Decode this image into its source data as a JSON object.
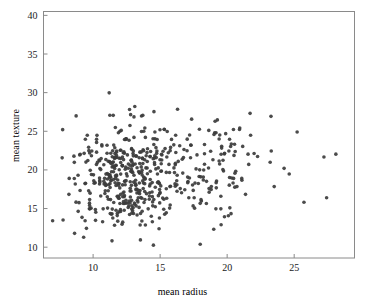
{
  "chart_data": {
    "type": "scatter",
    "title": "",
    "xlabel": "mean radius",
    "ylabel": "mean texture",
    "xlim": [
      6.3,
      29.5
    ],
    "ylim": [
      8.6,
      40.5
    ],
    "xticks": [
      10,
      15,
      20,
      25
    ],
    "xticklabels": [
      "10",
      "15",
      "20",
      "25"
    ],
    "yticks": [
      10,
      15,
      20,
      25,
      30,
      35,
      40
    ],
    "yticklabels": [
      "10",
      "15",
      "20",
      "25",
      "30",
      "35",
      "40"
    ],
    "grid": false,
    "legend": null,
    "n_points": 569,
    "marker": {
      "shape": "circle",
      "size_px": 3.6,
      "color": "#3c3c3c",
      "opacity": 0.92
    },
    "frame": {
      "color": "#8a8a8a",
      "visible": true
    },
    "background": "#ffffff",
    "x": [
      17.99,
      20.57,
      19.69,
      11.42,
      20.29,
      12.45,
      18.25,
      13.71,
      13.0,
      12.46,
      16.02,
      15.78,
      19.17,
      15.85,
      13.73,
      14.54,
      14.68,
      16.13,
      19.81,
      13.54,
      13.08,
      9.504,
      15.34,
      21.16,
      16.65,
      17.14,
      14.58,
      18.61,
      15.3,
      17.57,
      18.63,
      11.84,
      17.02,
      19.27,
      16.13,
      16.74,
      14.25,
      13.03,
      14.99,
      13.48,
      13.44,
      10.95,
      19.07,
      13.28,
      13.17,
      18.65,
      8.196,
      13.17,
      12.05,
      13.49,
      11.76,
      13.64,
      11.94,
      18.22,
      15.1,
      11.52,
      19.21,
      14.71,
      13.05,
      8.618,
      10.17,
      8.598,
      14.25,
      9.173,
      12.68,
      14.78,
      9.465,
      11.31,
      9.029,
      12.78,
      18.94,
      8.888,
      17.2,
      13.8,
      12.31,
      16.07,
      13.53,
      18.05,
      20.18,
      12.86,
      11.45,
      13.34,
      25.22,
      19.1,
      12.0,
      18.46,
      14.48,
      19.02,
      12.36,
      14.64,
      14.62,
      15.37,
      13.27,
      13.45,
      15.06,
      20.26,
      12.18,
      9.787,
      11.6,
      14.42,
      13.61,
      6.981,
      12.18,
      9.876,
      10.49,
      13.11,
      11.64,
      12.36,
      22.27,
      11.34,
      9.777,
      12.63,
      14.26,
      10.51,
      8.726,
      11.93,
      8.95,
      14.87,
      15.78,
      17.95,
      11.41,
      18.66,
      24.25,
      14.5,
      13.37,
      13.85,
      13.61,
      19.0,
      15.1,
      19.79,
      12.19,
      15.46,
      16.16,
      15.71,
      18.45,
      12.77,
      11.71,
      11.43,
      14.95,
      11.28,
      9.738,
      16.11,
      11.43,
      12.9,
      10.75,
      11.9,
      11.8,
      14.95,
      14.44,
      13.74,
      13.0,
      8.219,
      9.731,
      11.15,
      13.15,
      12.25,
      17.68,
      16.84,
      12.06,
      10.9,
      11.75,
      19.19,
      19.59,
      12.34,
      23.27,
      14.97,
      10.8,
      16.78,
      17.47,
      14.97,
      12.32,
      13.43,
      15.46,
      11.08,
      10.66,
      8.671,
      9.904,
      16.46,
      13.01,
      12.81,
      27.22,
      21.09,
      15.7,
      11.41,
      15.28,
      10.08,
      18.31,
      11.71,
      11.81,
      12.3,
      14.22,
      12.77,
      9.72,
      12.34,
      14.86,
      12.91,
      13.77,
      18.08,
      19.18,
      14.45,
      12.23,
      17.54,
      23.29,
      13.81,
      12.47,
      15.12,
      9.876,
      17.01,
      13.11,
      15.27,
      20.58,
      11.84,
      28.11,
      17.42,
      14.19,
      13.86,
      11.89,
      10.2,
      19.8,
      19.53,
      13.65,
      13.56,
      10.18,
      15.75,
      13.27,
      14.34,
      10.44,
      15.0,
      12.62,
      12.83,
      17.05,
      11.32,
      11.22,
      20.51,
      9.567,
      14.03,
      23.21,
      20.48,
      14.22,
      17.46,
      13.64,
      12.42,
      11.3,
      13.75,
      19.4,
      10.48,
      13.2,
      12.89,
      10.65,
      11.52,
      20.94,
      11.5,
      19.73,
      17.3,
      19.45,
      13.96,
      19.55,
      15.32,
      15.66,
      15.53,
      20.31,
      17.35,
      17.29,
      15.61,
      17.19,
      20.73,
      10.6,
      13.59,
      12.87,
      10.71,
      14.29,
      11.29,
      21.75,
      9.742,
      17.93,
      11.89,
      11.33,
      18.81,
      13.59,
      13.85,
      19.16,
      11.74,
      19.4,
      16.24,
      12.89,
      12.58,
      11.94,
      12.89,
      11.26,
      11.37,
      14.41,
      14.96,
      12.95,
      11.85,
      12.72,
      13.77,
      10.91,
      11.76,
      14.26,
      10.51,
      19.53,
      12.46,
      20.09,
      10.49,
      11.46,
      11.6,
      13.2,
      9.0,
      13.5,
      13.05,
      11.7,
      14.61,
      12.76,
      11.54,
      8.597,
      12.49,
      12.18,
      18.22,
      9.042,
      12.43,
      10.25,
      20.16,
      12.86,
      20.34,
      12.2,
      12.67,
      14.11,
      12.03,
      16.27,
      16.26,
      16.03,
      12.98,
      11.22,
      11.25,
      12.3,
      17.06,
      12.99,
      18.77,
      10.05,
      23.51,
      14.42,
      9.606,
      11.06,
      19.68,
      11.71,
      10.26,
      12.06,
      14.76,
      11.47,
      11.95,
      11.66,
      15.75,
      25.73,
      15.08,
      11.14,
      12.56,
      13.05,
      13.87,
      8.878,
      9.436,
      12.54,
      13.3,
      12.76,
      16.5,
      13.4,
      20.44,
      20.2,
      12.21,
      21.71,
      22.01,
      16.35,
      15.19,
      21.37,
      20.64,
      13.69,
      16.17,
      10.57,
      13.46,
      13.66,
      11.08,
      11.27,
      11.04,
      12.05,
      12.39,
      13.28,
      14.6,
      12.21,
      13.88,
      11.27,
      19.55,
      10.26,
      8.734,
      15.49,
      21.61,
      12.1,
      14.06,
      13.51,
      12.8,
      11.06,
      11.8,
      17.91,
      11.93,
      12.96,
      12.94,
      12.34,
      10.94,
      16.14,
      12.85,
      17.99,
      12.27,
      11.36,
      11.04,
      9.397,
      14.99,
      15.13,
      11.89,
      9.405,
      15.5,
      12.7,
      11.16,
      11.57,
      14.69,
      11.61,
      13.66,
      9.742,
      10.03,
      10.48,
      10.8,
      11.13,
      12.72,
      14.9,
      12.4,
      20.18,
      18.82,
      14.86,
      13.98,
      12.87,
      14.04,
      13.85,
      14.02,
      10.97,
      17.27,
      13.78,
      10.57,
      18.03,
      11.99,
      17.75,
      14.8,
      14.53,
      21.1,
      11.87,
      19.59,
      12.0,
      14.53,
      12.62,
      13.38,
      11.63,
      13.21,
      13.0,
      9.755,
      17.08,
      27.42,
      14.4,
      11.6,
      13.17,
      13.24,
      13.14,
      9.668,
      17.6,
      11.62,
      9.667,
      12.04,
      14.92,
      12.27,
      10.88,
      12.83,
      14.2,
      13.9,
      11.49,
      16.25,
      12.16,
      13.9,
      13.47,
      13.7,
      15.73,
      12.45,
      14.64,
      19.44,
      11.68,
      16.69,
      12.25,
      17.85,
      18.31,
      11.22,
      12.06,
      16.3,
      15.46,
      11.74,
      14.81,
      13.4,
      14.58,
      15.05,
      11.34,
      18.31,
      19.89,
      12.88,
      12.75,
      9.295,
      24.63,
      11.26,
      13.71,
      9.847,
      8.571,
      13.46,
      12.34,
      13.94,
      12.07,
      11.75,
      11.67,
      13.68,
      20.47,
      10.96,
      20.55,
      14.27,
      11.69,
      7.729,
      7.691,
      11.54,
      14.47,
      14.74,
      13.21,
      13.87,
      13.62,
      10.32,
      10.26,
      9.683,
      10.82,
      10.86,
      11.13,
      12.77,
      9.333,
      12.88,
      10.29,
      10.16,
      9.423,
      14.59,
      11.51,
      14.05,
      11.2,
      15.22,
      20.92,
      21.56,
      20.13,
      16.6,
      20.6,
      7.76
    ],
    "y": [
      10.38,
      17.77,
      21.25,
      20.38,
      14.34,
      15.7,
      19.98,
      20.83,
      21.82,
      24.04,
      23.24,
      17.89,
      24.8,
      23.95,
      22.61,
      27.54,
      20.13,
      20.68,
      22.15,
      14.36,
      15.71,
      12.44,
      14.26,
      23.04,
      21.38,
      16.4,
      21.53,
      20.25,
      25.27,
      15.05,
      25.11,
      18.7,
      23.98,
      26.47,
      17.88,
      21.59,
      21.72,
      18.42,
      25.2,
      20.82,
      21.58,
      21.35,
      24.81,
      20.28,
      18.66,
      17.6,
      16.84,
      21.81,
      14.63,
      22.3,
      21.6,
      16.34,
      18.24,
      18.7,
      22.02,
      18.75,
      18.57,
      21.59,
      19.31,
      11.79,
      14.88,
      20.98,
      21.72,
      13.86,
      23.84,
      23.94,
      21.01,
      19.04,
      17.33,
      16.49,
      21.31,
      14.64,
      24.52,
      15.79,
      16.52,
      19.65,
      10.94,
      16.15,
      23.97,
      18.0,
      20.97,
      15.86,
      24.91,
      26.29,
      15.65,
      18.52,
      21.46,
      24.59,
      18.54,
      15.24,
      24.02,
      22.76,
      17.02,
      18.3,
      19.83,
      23.03,
      20.52,
      19.94,
      12.84,
      16.54,
      24.98,
      13.43,
      20.58,
      19.4,
      18.61,
      15.56,
      18.33,
      18.54,
      21.73,
      18.61,
      16.99,
      20.76,
      18.17,
      20.19,
      15.83,
      21.53,
      15.76,
      16.67,
      22.91,
      20.01,
      10.82,
      17.12,
      20.2,
      10.26,
      16.39,
      17.21,
      26.97,
      12.33,
      19.86,
      22.07,
      21.68,
      19.68,
      24.49,
      15.06,
      15.65,
      20.59,
      17.98,
      14.93,
      13.77,
      14.36,
      15.39,
      18.19,
      21.71,
      15.35,
      14.96,
      16.33,
      14.09,
      18.22,
      15.86,
      17.6,
      20.7,
      18.9,
      15.7,
      19.39,
      18.22,
      22.22,
      20.13,
      17.43,
      20.96,
      18.22,
      19.34,
      17.68,
      22.82,
      22.15,
      26.93,
      16.95,
      20.67,
      22.64,
      17.35,
      15.73,
      14.78,
      15.15,
      14.45,
      18.82,
      23.09,
      18.17,
      22.45,
      23.12,
      14.36,
      19.82,
      21.68,
      18.9,
      19.67,
      14.32,
      16.21,
      18.28,
      20.74,
      14.78,
      14.38,
      17.15,
      17.93,
      18.47,
      14.97,
      15.67,
      18.47,
      21.0,
      19.07,
      15.98,
      18.35,
      15.35,
      17.0,
      16.39,
      22.44,
      18.94,
      24.04,
      21.28,
      21.84,
      22.48,
      28.21,
      14.9,
      19.56,
      13.37,
      22.04,
      18.05,
      16.21,
      25.42,
      24.81,
      14.52,
      13.93,
      16.59,
      19.97,
      16.41,
      13.47,
      15.46,
      17.48,
      14.0,
      21.28,
      17.07,
      15.15,
      17.27,
      19.07,
      22.15,
      19.07,
      21.88,
      24.49,
      20.25,
      21.0,
      18.9,
      17.05,
      15.34,
      13.39,
      23.95,
      16.16,
      18.31,
      24.0,
      18.95,
      17.44,
      19.73,
      23.24,
      19.77,
      25.42,
      27.06,
      19.86,
      23.19,
      24.52,
      21.84,
      22.02,
      25.22,
      20.71,
      24.98,
      23.34,
      26.57,
      23.22,
      22.22,
      18.95,
      17.84,
      21.47,
      20.39,
      16.06,
      13.29,
      22.39,
      19.12,
      24.48,
      16.16,
      25.27,
      18.03,
      18.65,
      17.46,
      22.33,
      21.31,
      14.96,
      21.9,
      21.15,
      18.6,
      19.9,
      15.71,
      16.33,
      14.41,
      18.22,
      19.76,
      18.36,
      17.46,
      14.71,
      18.23,
      27.81,
      22.47,
      17.31,
      22.44,
      18.75,
      18.45,
      14.96,
      18.61,
      14.06,
      21.18,
      22.47,
      21.49,
      18.05,
      21.94,
      17.33,
      24.21,
      20.58,
      24.91,
      15.73,
      23.21,
      18.89,
      19.49,
      20.56,
      19.07,
      22.02,
      20.37,
      20.7,
      18.03,
      21.26,
      18.95,
      18.06,
      15.35,
      14.96,
      22.55,
      19.31,
      17.24,
      20.26,
      22.13,
      19.38,
      27.08,
      22.33,
      18.35,
      15.11,
      22.41,
      18.6,
      17.84,
      13.29,
      21.21,
      19.54,
      20.04,
      20.6,
      23.97,
      16.84,
      22.44,
      13.78,
      20.03,
      25.49,
      22.49,
      15.82,
      20.8,
      16.21,
      21.94,
      26.86,
      18.79,
      19.31,
      18.26,
      19.21,
      16.07,
      17.27,
      17.58,
      17.05,
      18.3,
      15.09,
      13.24,
      27.32,
      22.13,
      21.1,
      16.35,
      16.84,
      19.83,
      21.46,
      22.26,
      20.04,
      19.59,
      14.65,
      15.06,
      17.72,
      22.16,
      21.47,
      18.07,
      14.16,
      21.82,
      16.52,
      18.93,
      20.99,
      12.91,
      22.3,
      26.99,
      16.33,
      20.71,
      25.11,
      22.73,
      12.87,
      27.15,
      16.52,
      16.58,
      19.15,
      14.59,
      19.67,
      20.53,
      23.94,
      17.98,
      20.86,
      20.15,
      15.67,
      21.33,
      14.26,
      23.19,
      18.23,
      21.32,
      21.93,
      16.58,
      13.43,
      21.68,
      15.98,
      18.07,
      20.39,
      22.88,
      20.19,
      19.34,
      22.18,
      19.36,
      18.17,
      18.54,
      17.31,
      14.23,
      18.36,
      20.09,
      19.02,
      17.85,
      20.26,
      16.93,
      22.75,
      21.08,
      18.22,
      22.24,
      18.07,
      21.57,
      25.0,
      16.62,
      19.1,
      17.67,
      21.94,
      19.47,
      23.29,
      18.66,
      16.52,
      23.07,
      25.0,
      16.18,
      20.22,
      17.35,
      22.13,
      15.34,
      22.46,
      14.96,
      18.49,
      16.39,
      17.15,
      21.6,
      18.02,
      21.78,
      20.76,
      17.29,
      18.29,
      22.87,
      22.93,
      14.86,
      12.39,
      15.9,
      16.94,
      21.24,
      16.62,
      24.21,
      20.52,
      18.07,
      12.96,
      12.87,
      16.93,
      18.6,
      17.84,
      16.07,
      17.75,
      20.76,
      18.9,
      19.59,
      15.66,
      18.24,
      23.29,
      21.08,
      19.46,
      27.85,
      17.57,
      22.29,
      18.36,
      19.78,
      20.94,
      17.93,
      20.82,
      22.1,
      24.69,
      22.68,
      25.74,
      11.28,
      19.48,
      19.35,
      27.06,
      15.05,
      21.78,
      19.66,
      16.67,
      20.26,
      22.54,
      19.22,
      19.24,
      21.54,
      25.22,
      19.46,
      23.33,
      19.82,
      21.6,
      25.21,
      21.56,
      15.79,
      24.04,
      22.14,
      17.53,
      16.16,
      19.67,
      20.97,
      23.56,
      22.49,
      18.19,
      18.91,
      21.13,
      17.62,
      22.14,
      14.93,
      24.47,
      18.34,
      23.97,
      20.7,
      21.02,
      19.51,
      29.97,
      22.41,
      25.22,
      22.04,
      22.44,
      17.05,
      22.39,
      13.52,
      24.89,
      19.83,
      27.88,
      24.54
    ]
  },
  "figure": {
    "xlabel": "mean radius",
    "ylabel": "mean texture"
  }
}
